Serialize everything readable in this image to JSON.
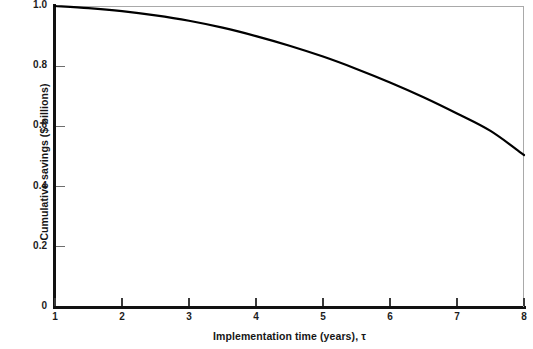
{
  "chart_data": {
    "type": "line",
    "title": "",
    "xlabel": "Implementation time (years), τ",
    "ylabel": "Cumulative savings ($ billions)",
    "xlim": [
      1,
      8
    ],
    "ylim": [
      0,
      1.0
    ],
    "grid": false,
    "legend": null,
    "xticks": [
      1,
      2,
      3,
      4,
      5,
      6,
      7,
      8
    ],
    "xticklabels": [
      "1",
      "2",
      "3",
      "4",
      "5",
      "6",
      "7",
      "8"
    ],
    "yticks": [
      0,
      0.2,
      0.4,
      0.6,
      0.8,
      1.0
    ],
    "yticklabels": [
      "0",
      "0.2",
      "0.4",
      "0.6",
      "0.8",
      "1.0"
    ],
    "series": [
      {
        "name": "Cumulative savings",
        "color": "#000000",
        "linewidth": 2.2,
        "x": [
          1.0,
          1.5,
          2.0,
          2.5,
          3.0,
          3.5,
          4.0,
          4.5,
          5.0,
          5.5,
          6.0,
          6.5,
          7.0,
          7.5,
          8.0
        ],
        "y": [
          1.0,
          0.993,
          0.983,
          0.969,
          0.951,
          0.928,
          0.9,
          0.868,
          0.832,
          0.791,
          0.746,
          0.697,
          0.643,
          0.585,
          0.505
        ]
      }
    ]
  },
  "axes": {
    "x_axis_name": "implementation-time-axis",
    "y_axis_name": "cumulative-savings-axis"
  }
}
